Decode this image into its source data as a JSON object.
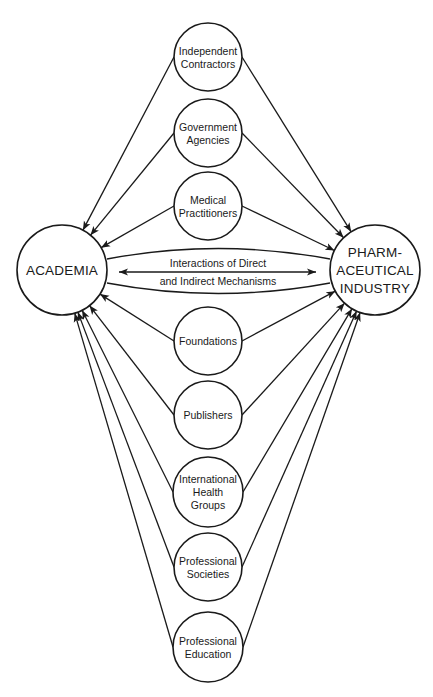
{
  "diagram": {
    "hubs": {
      "academia": {
        "lines": [
          "ACADEMIA"
        ],
        "cx": 62,
        "cy": 270,
        "r": 45
      },
      "pharma": {
        "lines": [
          "PHARM-",
          "ACEUTICAL",
          "INDUSTRY"
        ],
        "cx": 375,
        "cy": 270,
        "r": 45
      }
    },
    "center_link": {
      "lines": [
        "Interactions of Direct",
        "and Indirect Mechanisms"
      ],
      "arrow": "bidirectional"
    },
    "nodes": [
      {
        "id": "independent-contractors",
        "lines": [
          "Independent",
          "Contractors"
        ],
        "cy": 57,
        "r": 34
      },
      {
        "id": "government-agencies",
        "lines": [
          "Government",
          "Agencies"
        ],
        "cy": 133,
        "r": 34
      },
      {
        "id": "medical-practitioners",
        "lines": [
          "Medical",
          "Practitioners"
        ],
        "cy": 206,
        "r": 34
      },
      {
        "id": "foundations",
        "lines": [
          "Foundations"
        ],
        "cy": 341,
        "r": 34
      },
      {
        "id": "publishers",
        "lines": [
          "Publishers"
        ],
        "cy": 415,
        "r": 34
      },
      {
        "id": "international-health-groups",
        "lines": [
          "International",
          "Health",
          "Groups"
        ],
        "cy": 492,
        "r": 35
      },
      {
        "id": "professional-societies",
        "lines": [
          "Professional",
          "Societies"
        ],
        "cy": 567,
        "r": 34
      },
      {
        "id": "professional-education",
        "lines": [
          "Professional",
          "Education"
        ],
        "cy": 647,
        "r": 35
      }
    ],
    "node_cx": 208,
    "edge_direction": "from each intermediary node toward ACADEMIA and toward PHARMACEUTICAL INDUSTRY"
  }
}
